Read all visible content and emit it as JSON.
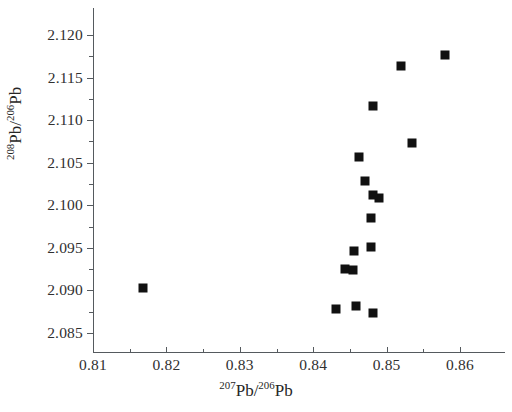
{
  "chart_data": {
    "type": "scatter",
    "title": "",
    "xlabel": "207Pb/206Pb",
    "ylabel": "208Pb/206Pb",
    "xlabel_parts": {
      "sup1": "207",
      "mid": "Pb/",
      "sup2": "206",
      "end": "Pb"
    },
    "ylabel_parts": {
      "sup1": "208",
      "mid": "Pb/",
      "sup2": "206",
      "end": "Pb"
    },
    "xlim": [
      0.8075,
      0.8635
    ],
    "ylim": [
      2.0833,
      2.1215
    ],
    "grid": false,
    "legend": null,
    "xticks": [
      0.81,
      0.82,
      0.83,
      0.84,
      0.85,
      0.86
    ],
    "xtick_labels": [
      "0.81",
      "0.82",
      "0.83",
      "0.84",
      "0.85",
      "0.86"
    ],
    "xticks_minor": [
      0.815,
      0.825,
      0.835,
      0.845,
      0.855
    ],
    "yticks": [
      2.085,
      2.09,
      2.095,
      2.1,
      2.105,
      2.11,
      2.115,
      2.12
    ],
    "ytick_labels": [
      "2.085",
      "2.090",
      "2.095",
      "2.100",
      "2.105",
      "2.110",
      "2.115",
      "2.120"
    ],
    "yticks_minor": [
      2.0875,
      2.0925,
      2.0975,
      2.1025,
      2.1075,
      2.1125,
      2.1175
    ],
    "marker": "filled-square",
    "marker_color": "#111111",
    "marker_size_px": 9,
    "points": [
      {
        "x": 0.8168,
        "y": 2.0903
      },
      {
        "x": 0.8431,
        "y": 2.0878
      },
      {
        "x": 0.8458,
        "y": 2.0882
      },
      {
        "x": 0.8481,
        "y": 2.0873
      },
      {
        "x": 0.8444,
        "y": 2.0925
      },
      {
        "x": 0.8454,
        "y": 2.0924
      },
      {
        "x": 0.8456,
        "y": 2.0946
      },
      {
        "x": 0.8479,
        "y": 2.0951
      },
      {
        "x": 0.8479,
        "y": 2.0985
      },
      {
        "x": 0.8489,
        "y": 2.1008
      },
      {
        "x": 0.8481,
        "y": 2.1012
      },
      {
        "x": 0.847,
        "y": 2.1028
      },
      {
        "x": 0.8463,
        "y": 2.1057
      },
      {
        "x": 0.8482,
        "y": 2.1117
      },
      {
        "x": 0.8535,
        "y": 2.1073
      },
      {
        "x": 0.8519,
        "y": 2.1164
      },
      {
        "x": 0.858,
        "y": 2.1176
      }
    ]
  }
}
